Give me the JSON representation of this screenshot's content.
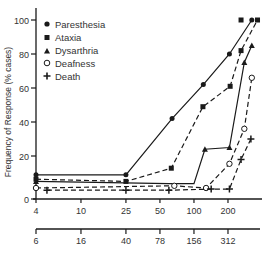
{
  "chart_data": {
    "type": "line",
    "title": "",
    "ylabel": "Frequency of Response (% cases)",
    "xlabel": "",
    "x_scale": "log",
    "ylim": [
      0,
      100
    ],
    "y_ticks": [
      0,
      20,
      40,
      60,
      80,
      100
    ],
    "x_axis_primary": {
      "ticks": [
        4,
        10,
        25,
        50,
        100,
        200
      ],
      "tick_labels": [
        "4",
        "10",
        "25",
        "50",
        "100",
        "200"
      ]
    },
    "x_axis_secondary": {
      "ticks": [
        4,
        10,
        25,
        50,
        100,
        200
      ],
      "tick_labels": [
        "6",
        "16",
        "40",
        "78",
        "156",
        "312"
      ]
    },
    "grid": false,
    "legend_position": "upper-left",
    "series": [
      {
        "name": "Paresthesia",
        "marker": "filled-circle",
        "line": "solid",
        "points": [
          [
            4,
            11
          ],
          [
            25,
            11
          ],
          [
            64,
            42
          ],
          [
            121,
            62
          ],
          [
            206,
            80
          ],
          [
            325,
            100
          ]
        ]
      },
      {
        "name": "Ataxia",
        "marker": "filled-square",
        "line": "dashed",
        "points": [
          [
            4,
            9
          ],
          [
            25,
            8
          ],
          [
            63,
            14
          ],
          [
            120,
            49
          ],
          [
            209,
            61
          ],
          [
            261,
            82
          ],
          [
            365,
            100
          ]
        ]
      },
      {
        "name": "Dysarthria",
        "marker": "filled-triangle",
        "line": "solid",
        "points": [
          [
            4,
            8
          ],
          [
            60,
            7
          ],
          [
            100,
            7
          ],
          [
            125,
            24
          ],
          [
            206,
            25
          ],
          [
            279,
            75
          ],
          [
            325,
            85
          ]
        ]
      },
      {
        "name": "Deafness",
        "marker": "open-circle",
        "line": "dashed",
        "points": [
          [
            4,
            5
          ],
          [
            67,
            6
          ],
          [
            128,
            5
          ],
          [
            206,
            16
          ],
          [
            279,
            36
          ],
          [
            325,
            66
          ]
        ]
      },
      {
        "name": "Death",
        "marker": "cross",
        "line": "solid-dashed",
        "points": [
          [
            5,
            4
          ],
          [
            25,
            4
          ],
          [
            60,
            4
          ],
          [
            142,
            4.5
          ],
          [
            206,
            4.5
          ],
          [
            261,
            18
          ],
          [
            319,
            30
          ]
        ]
      }
    ],
    "extra_points": [
      {
        "series": "Ataxia",
        "x": 261,
        "y": 100
      }
    ]
  },
  "legend": {
    "items": [
      {
        "label": "Paresthesia"
      },
      {
        "label": "Ataxia"
      },
      {
        "label": "Dysarthria"
      },
      {
        "label": "Deafness"
      },
      {
        "label": "Death"
      }
    ]
  },
  "axes": {
    "y_label": "Frequency of Response (% cases)",
    "y_tick_labels": [
      "0",
      "20",
      "40",
      "60",
      "80",
      "100"
    ],
    "x1_tick_labels": [
      "4",
      "10",
      "25",
      "50",
      "100",
      "200"
    ],
    "x2_tick_labels": [
      "6",
      "16",
      "40",
      "78",
      "156",
      "312"
    ]
  },
  "colors": {
    "ink": "#1a1a1a",
    "text": "#333333",
    "background": "#ffffff"
  }
}
